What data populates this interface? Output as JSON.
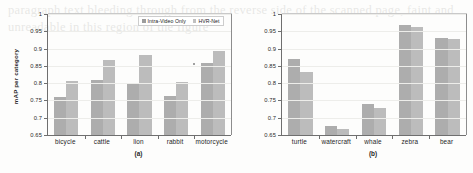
{
  "figure": {
    "ylabel": "mAP per category",
    "legend": [
      {
        "label": "Intra-Video Only",
        "color": "#adadad",
        "key": "intra_video_only"
      },
      {
        "label": "HVR-Net",
        "color": "#bcbcbc",
        "key": "hvr_net"
      }
    ],
    "yticks": [
      "0.65",
      "0.7",
      "0.75",
      "0.8",
      "0.85",
      "0.9",
      "0.95",
      "1"
    ],
    "panel_a_caption": "(a)",
    "panel_b_caption": "(b)"
  },
  "bleed_text": "paragraph text bleeding through from the reverse side of the scanned page, faint and unreadable in this region of the figure",
  "chart_data": [
    {
      "type": "bar",
      "title": "(a)",
      "xlabel": "",
      "ylabel": "mAP per category",
      "ylim": [
        0.65,
        1.0
      ],
      "ytick_step": 0.05,
      "grid": true,
      "legend_position": "top-right",
      "categories": [
        "bicycle",
        "cattle",
        "lion",
        "rabbit",
        "motorcycle"
      ],
      "series": [
        {
          "name": "Intra-Video Only",
          "values": [
            0.761,
            0.81,
            0.8,
            0.764,
            0.857
          ]
        },
        {
          "name": "HVR-Net",
          "values": [
            0.805,
            0.866,
            0.881,
            0.804,
            0.894
          ]
        }
      ]
    },
    {
      "type": "bar",
      "title": "(b)",
      "xlabel": "",
      "ylabel": "mAP per category",
      "ylim": [
        0.65,
        1.0
      ],
      "ytick_step": 0.05,
      "grid": true,
      "legend_position": "top-right",
      "categories": [
        "turtle",
        "watercraft",
        "whale",
        "zebra",
        "bear"
      ],
      "series": [
        {
          "name": "Intra-Video Only",
          "values": [
            0.871,
            0.676,
            0.741,
            0.968,
            0.931
          ]
        },
        {
          "name": "HVR-Net",
          "values": [
            0.833,
            0.666,
            0.729,
            0.963,
            0.929
          ]
        }
      ]
    }
  ]
}
